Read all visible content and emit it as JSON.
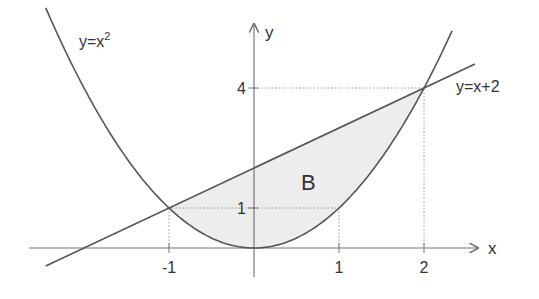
{
  "chart_data": {
    "type": "line",
    "title": "",
    "xlabel": "x",
    "ylabel": "y",
    "xlim": [
      -2.5,
      2.7
    ],
    "ylim": [
      -0.6,
      4.8
    ],
    "x_ticks": [
      {
        "value": -1,
        "label": "-1"
      },
      {
        "value": 1,
        "label": "1"
      },
      {
        "value": 2,
        "label": "2"
      }
    ],
    "y_ticks": [
      {
        "value": 1,
        "label": "1"
      },
      {
        "value": 4,
        "label": "4"
      }
    ],
    "series": [
      {
        "name": "parabola",
        "label_base": "y=x",
        "label_sup": "2",
        "function": "x^2",
        "domain": [
          -2.45,
          2.33
        ]
      },
      {
        "name": "line",
        "label": "y=x+2",
        "function": "x+2",
        "domain": [
          -2.45,
          2.6
        ]
      }
    ],
    "region": {
      "label": "B",
      "between": [
        "x+2",
        "x^2"
      ],
      "x_range": [
        -1,
        2
      ],
      "fill": "#ededed"
    },
    "intersections": [
      {
        "x": -1,
        "y": 1
      },
      {
        "x": 2,
        "y": 4
      }
    ],
    "guide_lines": [
      {
        "from": [
          -1,
          0
        ],
        "to": [
          -1,
          1
        ]
      },
      {
        "from": [
          0,
          1
        ],
        "to": [
          -1,
          1
        ]
      },
      {
        "from": [
          1,
          0
        ],
        "to": [
          1,
          1
        ]
      },
      {
        "from": [
          0,
          1
        ],
        "to": [
          1,
          1
        ]
      },
      {
        "from": [
          2,
          0
        ],
        "to": [
          2,
          4
        ]
      },
      {
        "from": [
          0,
          4
        ],
        "to": [
          2,
          4
        ]
      }
    ],
    "grid": false,
    "colors": {
      "curve": "#555555",
      "axis": "#777777",
      "guide": "#999999"
    }
  }
}
